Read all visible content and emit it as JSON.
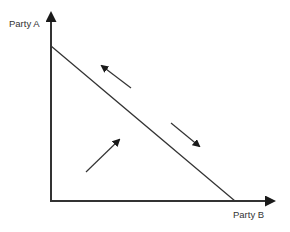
{
  "diagram": {
    "type": "two-party tradeoff diagram",
    "y_axis": {
      "label": "Party A"
    },
    "x_axis": {
      "label": "Party B"
    },
    "frontier": {
      "description": "straight downward-sloping line from y-axis to x-axis",
      "start": [
        51,
        46
      ],
      "end": [
        235,
        201
      ]
    },
    "arrows": [
      {
        "name": "arrow-toward-party-a",
        "direction": "up-left, along frontier",
        "from": [
          131,
          88
        ],
        "to": [
          100,
          65
        ]
      },
      {
        "name": "arrow-toward-party-b",
        "direction": "down-right, along frontier",
        "from": [
          171,
          123
        ],
        "to": [
          201,
          147
        ]
      },
      {
        "name": "arrow-toward-frontier",
        "direction": "up-right, toward frontier from inside",
        "from": [
          86,
          172
        ],
        "to": [
          121,
          138
        ]
      }
    ],
    "colors": {
      "line": "#333333",
      "background": "#ffffff"
    }
  }
}
